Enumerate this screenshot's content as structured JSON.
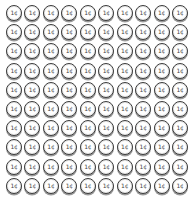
{
  "coin": {
    "label": "1¢",
    "name": "penny"
  },
  "grid": {
    "rows": 10,
    "cols": 10,
    "total": 100
  },
  "colors": {
    "ring": "#3a3a3a",
    "shadow": "#9a9a9a",
    "face": "#ffffff",
    "text": "#444444"
  }
}
